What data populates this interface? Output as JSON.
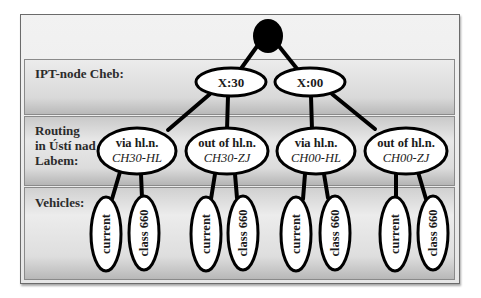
{
  "diagram": {
    "type": "decision-tree",
    "levels": [
      {
        "label": "IPT-node Cheb:"
      },
      {
        "label_lines": [
          "Routing",
          "in Ústí nad",
          "Labem:"
        ]
      },
      {
        "label": "Vehicles:"
      }
    ],
    "root": {
      "shape": "filled-black-circle"
    },
    "ipt_nodes": [
      {
        "label": "X:30"
      },
      {
        "label": "X:00"
      }
    ],
    "routing_nodes": [
      {
        "line1": "via hl.n.",
        "line2": "CH30-HL",
        "parent": "X:30"
      },
      {
        "line1": "out of hl.n.",
        "line2": "CH30-ZJ",
        "parent": "X:30"
      },
      {
        "line1": "via hl.n.",
        "line2": "CH00-HL",
        "parent": "X:00"
      },
      {
        "line1": "out of hl.n.",
        "line2": "CH00-ZJ",
        "parent": "X:00"
      }
    ],
    "vehicle_nodes": [
      {
        "label": "current"
      },
      {
        "label": "class 660"
      },
      {
        "label": "current"
      },
      {
        "label": "class 660"
      },
      {
        "label": "current"
      },
      {
        "label": "class 660"
      },
      {
        "label": "current"
      },
      {
        "label": "class 660"
      }
    ],
    "colors": {
      "node_fill": "#ffffff",
      "node_stroke": "#000000",
      "root_fill": "#000000",
      "band_fill": "#dcdcdc",
      "label_text": "#2b2b2b"
    }
  }
}
